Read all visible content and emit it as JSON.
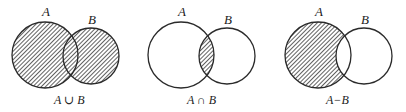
{
  "figure": {
    "type": "venn-diagrams",
    "style": {
      "stroke_color": "#2a2a2a",
      "hatch_color": "#3a3a3a",
      "background": "#ffffff"
    },
    "panels": [
      {
        "id": "union",
        "set_a_label": "A",
        "set_b_label": "B",
        "caption": "A ∪ B",
        "shaded_region": "A union B"
      },
      {
        "id": "intersection",
        "set_a_label": "A",
        "set_b_label": "B",
        "caption": "A ∩ B",
        "shaded_region": "A intersect B"
      },
      {
        "id": "difference",
        "set_a_label": "A",
        "set_b_label": "B",
        "caption": "A−B",
        "shaded_region": "A minus B"
      }
    ]
  }
}
